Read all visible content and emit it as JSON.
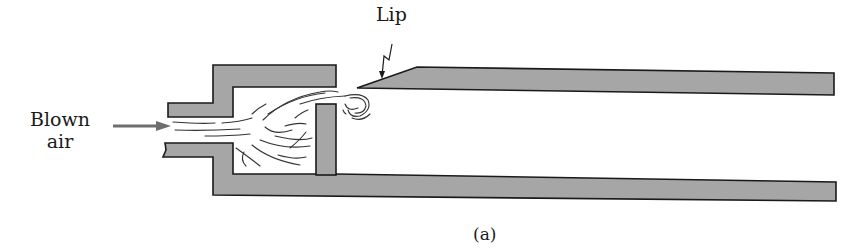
{
  "diagram": {
    "type": "cross-section",
    "labels": {
      "blown_air_line1": "Blown",
      "blown_air_line2": "air",
      "lip": "Lip",
      "caption": "(a)"
    },
    "colors": {
      "wall_fill": "#a6a6a6",
      "outline": "#1a1a1a",
      "arrow": "#6e6e6e",
      "background": "#ffffff"
    },
    "parts": [
      "inlet-tube",
      "air-chamber",
      "divider-wall",
      "lip",
      "resonator-tube-upper-wall",
      "resonator-tube-lower-wall",
      "air-jet-streamlines",
      "vortex"
    ]
  }
}
